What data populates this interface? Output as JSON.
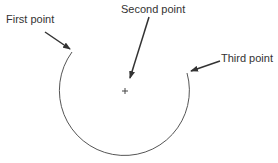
{
  "diagram": {
    "type": "three-point arc construction",
    "labels": {
      "first": "First point",
      "second": "Second point",
      "third": "Third point"
    },
    "colors": {
      "arc": "#555555",
      "arrow": "#333333",
      "text": "#333333",
      "background": "#ffffff"
    },
    "geometry": {
      "center": [
        125,
        91
      ],
      "radius": 65,
      "first_point": [
        72,
        52
      ],
      "third_point": [
        187,
        73
      ]
    },
    "markers": {
      "center_marker": "+"
    }
  }
}
